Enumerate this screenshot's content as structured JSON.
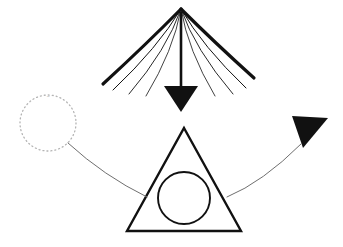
{
  "canvas": {
    "width": 343,
    "height": 247,
    "background": "#ffffff",
    "ink": "#111111",
    "faint_ink": "#b4b4b4",
    "thin_ink": "#6f6f6f"
  },
  "elements": {
    "fan_burst": {
      "name": "radiating-fan",
      "apex": {
        "x": 181,
        "y": 9
      },
      "stroke_color": "#111111",
      "rays": [
        {
          "id": "ray-left-outer",
          "end_x": 103,
          "end_y": 84,
          "width": 3.2,
          "bow": 4
        },
        {
          "id": "ray-left-mid",
          "end_x": 113,
          "end_y": 90,
          "width": 1.0,
          "bow": 11
        },
        {
          "id": "ray-left-inner",
          "end_x": 129,
          "end_y": 94,
          "width": 0.9,
          "bow": 12
        },
        {
          "id": "ray-left-innermost",
          "end_x": 146,
          "end_y": 96,
          "width": 0.8,
          "bow": 10
        },
        {
          "id": "ray-right-innermost",
          "end_x": 215,
          "end_y": 96,
          "width": 0.8,
          "bow": -10
        },
        {
          "id": "ray-right-inner",
          "end_x": 233,
          "end_y": 94,
          "width": 0.9,
          "bow": -12
        },
        {
          "id": "ray-right-mid",
          "end_x": 246,
          "end_y": 88,
          "width": 1.0,
          "bow": -11
        },
        {
          "id": "ray-right-outer",
          "end_x": 254,
          "end_y": 78,
          "width": 3.2,
          "bow": -4
        }
      ]
    },
    "down_arrow": {
      "name": "downward-arrow",
      "shaft": {
        "x": 181,
        "y_top": 12,
        "y_bottom": 88,
        "width": 2.6
      },
      "head": {
        "left_x": 164,
        "right_x": 198,
        "top_y": 86,
        "tip_x": 181,
        "tip_y": 112
      },
      "fill": "#111111"
    },
    "triangle": {
      "name": "outlined-triangle",
      "apex": {
        "x": 184,
        "y": 128
      },
      "left": {
        "x": 127,
        "y": 231
      },
      "right": {
        "x": 241,
        "y": 231
      },
      "stroke_color": "#111111",
      "stroke_width": 2.4,
      "fill": "none"
    },
    "inner_circle": {
      "name": "inscribed-circle",
      "cx": 184,
      "cy": 198,
      "r": 26,
      "stroke_color": "#111111",
      "stroke_width": 1.9,
      "fill": "none"
    },
    "dotted_circle": {
      "name": "dotted-circle",
      "cx": 48,
      "cy": 123,
      "r": 28,
      "stroke_color": "#b4b4b4",
      "stroke_width": 1.3,
      "dash": "1 3",
      "fill": "none",
      "smudge_label": "~"
    },
    "left_connector": {
      "name": "left-connector-curve",
      "start_x": 68,
      "start_y": 143,
      "end_x": 147,
      "end_y": 197,
      "ctrl_x": 104,
      "ctrl_y": 176,
      "stroke_color": "#6f6f6f",
      "stroke_width": 1.0
    },
    "right_connector": {
      "name": "right-connector-curve",
      "start_x": 227,
      "start_y": 197,
      "end_x": 301,
      "end_y": 144,
      "ctrl_x": 263,
      "ctrl_y": 182,
      "stroke_color": "#6f6f6f",
      "stroke_width": 1.0
    },
    "right_arrowhead": {
      "name": "right-arrowhead",
      "p1_x": 292,
      "p1_y": 116,
      "p2_x": 328,
      "p2_y": 118,
      "p3_x": 303,
      "p3_y": 148,
      "fill": "#111111"
    }
  }
}
